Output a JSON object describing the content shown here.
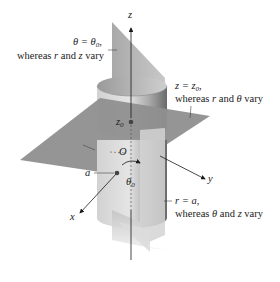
{
  "figure": {
    "colors": {
      "background": "#ffffff",
      "vertical_plane": "#b4b4b4",
      "vertical_plane_light": "#d6d6d6",
      "horizontal_plane": "#8f8f8f",
      "cylinder_light": "#d8d8d8",
      "cylinder_mid": "#bcbcbc",
      "cylinder_dark": "#6e6e6e",
      "axis": "#1a1a1a",
      "point": "#444444"
    },
    "axes": {
      "z": "z",
      "y": "y",
      "x": "x",
      "origin": "O"
    },
    "points": {
      "z0": "z",
      "z0_sub": "0",
      "a": "a",
      "theta0": "θ",
      "theta0_sub": "0"
    },
    "annotations": {
      "theta_plane": {
        "line1_lhs": "θ = θ",
        "line1_sub": "0",
        "line1_tail": ",",
        "line2_pre": "whereas ",
        "line2_var1": "r",
        "line2_mid": " and ",
        "line2_var2": "z",
        "line2_post": " vary"
      },
      "z_plane": {
        "line1_lhs": "z = z",
        "line1_sub": "0",
        "line1_tail": ",",
        "line2_pre": "whereas ",
        "line2_var1": "r",
        "line2_mid": " and ",
        "line2_var2": "θ",
        "line2_post": " vary"
      },
      "cylinder": {
        "line1_lhs": "r = a,",
        "line2_pre": "whereas ",
        "line2_var1": "θ",
        "line2_mid": " and ",
        "line2_var2": "z",
        "line2_post": " vary"
      }
    }
  }
}
